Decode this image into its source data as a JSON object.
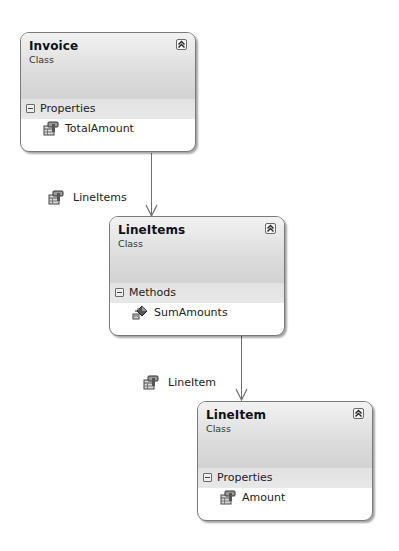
{
  "diagram": {
    "type": "class-diagram",
    "classes": [
      {
        "name": "Invoice",
        "kind": "Class",
        "compartment": "Properties",
        "members": [
          {
            "name": "TotalAmount",
            "icon": "property-icon"
          }
        ]
      },
      {
        "name": "LineItems",
        "kind": "Class",
        "compartment": "Methods",
        "members": [
          {
            "name": "SumAmounts",
            "icon": "method-icon"
          }
        ]
      },
      {
        "name": "LineItem",
        "kind": "Class",
        "compartment": "Properties",
        "members": [
          {
            "name": "Amount",
            "icon": "property-icon"
          }
        ]
      }
    ],
    "associations": [
      {
        "from": "Invoice",
        "to": "LineItems",
        "label": "LineItems",
        "icon": "property-icon"
      },
      {
        "from": "LineItems",
        "to": "LineItem",
        "label": "LineItem",
        "icon": "property-icon"
      }
    ],
    "colors": {
      "border": "#7a7a7a",
      "header": "#dcdcdc",
      "connector": "#707070"
    }
  }
}
